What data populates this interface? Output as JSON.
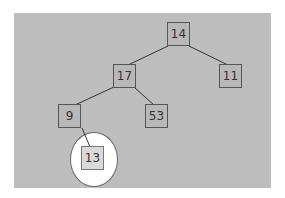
{
  "diagram": {
    "type": "tree",
    "background_color": "#bdbdbd",
    "nodes": [
      {
        "id": "n14",
        "label": "14",
        "x": 167,
        "y": 22
      },
      {
        "id": "n17",
        "label": "17",
        "x": 113,
        "y": 64
      },
      {
        "id": "n11",
        "label": "11",
        "x": 219,
        "y": 64
      },
      {
        "id": "n9",
        "label": "9",
        "x": 58,
        "y": 104
      },
      {
        "id": "n53",
        "label": "53",
        "x": 145,
        "y": 104
      },
      {
        "id": "n13",
        "label": "13",
        "x": 81,
        "y": 146,
        "highlighted": true
      }
    ],
    "edges": [
      {
        "from": "14",
        "to": "17"
      },
      {
        "from": "14",
        "to": "11"
      },
      {
        "from": "17",
        "to": "9"
      },
      {
        "from": "17",
        "to": "53"
      },
      {
        "from": "9",
        "to": "13"
      }
    ],
    "highlight": {
      "node": "13",
      "shape": "circle",
      "color": "#ffffff"
    }
  }
}
